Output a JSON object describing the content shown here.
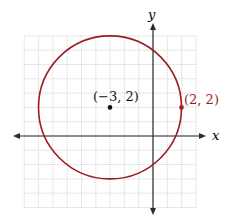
{
  "diagram": {
    "type": "coordinate-plane-circle",
    "axes": {
      "x_label": "x",
      "y_label": "y",
      "x_range": [
        -9,
        3
      ],
      "y_range": [
        -5,
        7
      ],
      "grid_step": 1
    },
    "circle": {
      "center": [
        -3,
        2
      ],
      "radius": 5,
      "color": "#9b1c24"
    },
    "points": [
      {
        "label": "(−3, 2)",
        "coords": [
          -3,
          2
        ],
        "color": "#111111"
      },
      {
        "label": "(2, 2)",
        "coords": [
          2,
          2
        ],
        "color": "#9b1c24"
      }
    ],
    "colors": {
      "grid": "#c9c9c9",
      "axis": "#2a2a2a",
      "background": "#ffffff"
    }
  }
}
